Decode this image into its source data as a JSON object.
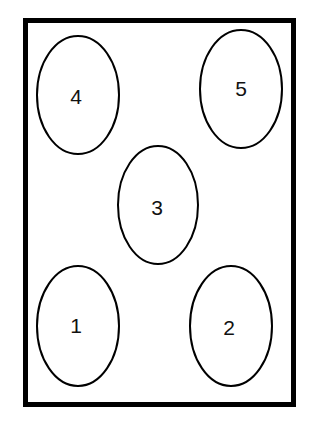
{
  "diagram": {
    "type": "numbered-layout",
    "colors": {
      "background": "#ffffff",
      "stroke": "#000000",
      "text": "#111111"
    },
    "spots": [
      {
        "label": "4",
        "position": "top-left"
      },
      {
        "label": "5",
        "position": "top-right"
      },
      {
        "label": "3",
        "position": "center"
      },
      {
        "label": "1",
        "position": "bottom-left"
      },
      {
        "label": "2",
        "position": "bottom-right"
      }
    ]
  }
}
